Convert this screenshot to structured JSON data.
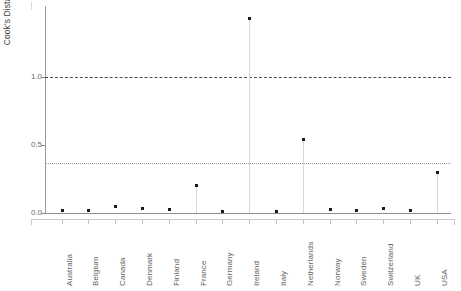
{
  "chart_data": {
    "type": "scatter",
    "title": "",
    "subtitle": "",
    "xlabel": "",
    "ylabel": "Cook's Distance",
    "categories": [
      "Australia",
      "Belgium",
      "Canada",
      "Denmark",
      "Finland",
      "France",
      "Germany",
      "Ireland",
      "Italy",
      "Netherlands",
      "Norway",
      "Sweden",
      "Switzerland",
      "UK",
      "USA"
    ],
    "values": [
      0.015,
      0.015,
      0.045,
      0.03,
      0.025,
      0.2,
      0.01,
      1.43,
      0.01,
      0.54,
      0.02,
      0.015,
      0.03,
      0.015,
      0.295
    ],
    "ylim": [
      0.0,
      1.5
    ],
    "yticks": [
      "0.0",
      "0.5",
      "1.0"
    ],
    "ytick_values": [
      0.0,
      0.5,
      1.0
    ],
    "grid": false,
    "legend": "none",
    "marker": "filled-square",
    "marker_color": "#1a1a1a",
    "stem_color": "#d9d9d9",
    "reference_lines": [
      {
        "name": "threshold-high",
        "value": 1.0,
        "style": "dashed",
        "color": "#4a4a4a"
      },
      {
        "name": "threshold-low",
        "value": 0.37,
        "style": "dotted",
        "color": "#9d9d9d"
      }
    ],
    "axis_color": "#8c8c8c"
  },
  "axis": {
    "ylabel_text": "Cook's Distance"
  }
}
